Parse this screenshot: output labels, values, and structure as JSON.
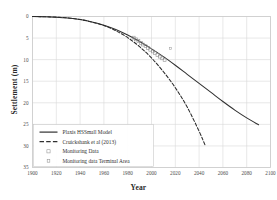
{
  "chart_data": {
    "type": "line",
    "title": "",
    "xlabel": "Year",
    "ylabel": "Settlement (m)",
    "xlim": [
      1900,
      2100
    ],
    "ylim": [
      0,
      35
    ],
    "y_inverted": true,
    "grid": true,
    "xticks": [
      1900,
      1920,
      1940,
      1960,
      1980,
      2000,
      2020,
      2040,
      2060,
      2080,
      2100
    ],
    "yticks": [
      0,
      5,
      10,
      15,
      20,
      25,
      30,
      35
    ],
    "legend_position": "lower-left",
    "series": [
      {
        "name": "Plaxis HSSmall Model",
        "style": "solid",
        "color": "#303030",
        "marker": "none",
        "x": [
          1900,
          1910,
          1920,
          1930,
          1940,
          1950,
          1960,
          1970,
          1980,
          1990,
          2000,
          2010,
          2020,
          2030,
          2040,
          2050,
          2060,
          2070,
          2080,
          2090
        ],
        "y": [
          0.0,
          0.05,
          0.15,
          0.35,
          0.7,
          1.25,
          2.0,
          3.0,
          4.3,
          5.8,
          7.5,
          9.3,
          11.3,
          13.4,
          15.5,
          17.6,
          19.7,
          21.7,
          23.5,
          25.1
        ]
      },
      {
        "name": "Cruickshank et al (2013)",
        "style": "dashed",
        "color": "#2a2a2a",
        "marker": "none",
        "x": [
          1900,
          1910,
          1920,
          1930,
          1940,
          1950,
          1960,
          1970,
          1980,
          1990,
          2000,
          2010,
          2020,
          2030,
          2040,
          2045
        ],
        "y": [
          0.0,
          0.05,
          0.15,
          0.35,
          0.7,
          1.3,
          2.1,
          3.3,
          4.9,
          7.0,
          9.6,
          12.8,
          16.5,
          21.0,
          26.6,
          29.8
        ]
      },
      {
        "name": "Monitoring Data",
        "style": "markers",
        "color": "#8a8a8a",
        "marker": "open-square",
        "x": [
          1985,
          1987,
          1989,
          1991,
          1993,
          1995,
          1997,
          1999,
          2001,
          2003,
          2005,
          2007,
          2009,
          2011
        ],
        "y": [
          4.9,
          5.3,
          5.7,
          6.1,
          6.5,
          6.9,
          7.3,
          7.7,
          8.1,
          8.5,
          8.9,
          9.3,
          9.7,
          10.1
        ]
      },
      {
        "name": "Monitoring data Terminal Area",
        "style": "markers",
        "color": "#9e9e9e",
        "marker": "open-square-small",
        "x": [
          2016
        ],
        "y": [
          7.4
        ]
      }
    ]
  },
  "legend": {
    "items": [
      {
        "label": "Plaxis HSSmall Model",
        "kind": "solid-line"
      },
      {
        "label": "Cruickshank et al (2013)",
        "kind": "dashed-line"
      },
      {
        "label": "Monitoring Data",
        "kind": "open-square"
      },
      {
        "label": "Monitoring data Terminal Area",
        "kind": "open-square-small"
      }
    ]
  },
  "colors": {
    "plot_line": "#303030",
    "grid": "#d9d9d9",
    "frame": "#c8c8c8",
    "text": "#3a3a3a",
    "marker": "#9a9a9a"
  }
}
